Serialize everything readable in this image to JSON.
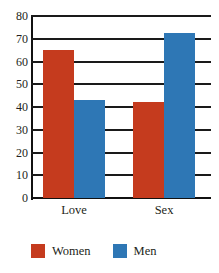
{
  "chart_data": {
    "type": "bar",
    "title": "",
    "xlabel": "",
    "ylabel": "",
    "categories": [
      "Love",
      "Sex"
    ],
    "series": [
      {
        "name": "Women",
        "color": "#c53b1e",
        "values": [
          65,
          42
        ]
      },
      {
        "name": "Men",
        "color": "#2e77b5",
        "values": [
          43,
          72.5
        ]
      }
    ],
    "ylim": [
      0,
      80
    ],
    "y_ticks": [
      80,
      70,
      60,
      50,
      40,
      30,
      20,
      10,
      0
    ],
    "grid": true,
    "legend_position": "bottom-left",
    "background_color": "#ffffff",
    "axis_color": "#111111"
  },
  "legend": {
    "items": [
      {
        "label": "Women",
        "color": "#c53b1e"
      },
      {
        "label": "Men",
        "color": "#2e77b5"
      }
    ]
  }
}
